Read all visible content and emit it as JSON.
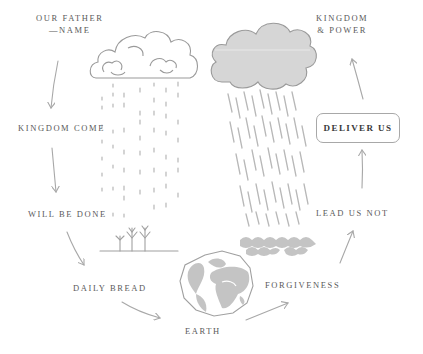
{
  "diagram": {
    "type": "cycle",
    "colors": {
      "text": "#5a5a5a",
      "stroke": "#a8a8a8",
      "fill": "#c4c4c4",
      "highlight_text": "#3a3a3a"
    },
    "nodes": [
      {
        "id": "our-father",
        "lines": [
          "OUR FATHER",
          "—NAME"
        ]
      },
      {
        "id": "kingdom-come",
        "lines": [
          "KINGDOM COME"
        ]
      },
      {
        "id": "will-be-done",
        "lines": [
          "WILL BE DONE"
        ]
      },
      {
        "id": "daily-bread",
        "lines": [
          "DAILY BREAD"
        ]
      },
      {
        "id": "earth",
        "lines": [
          "EARTH"
        ]
      },
      {
        "id": "forgiveness",
        "lines": [
          "FORGIVENESS"
        ]
      },
      {
        "id": "lead-us-not",
        "lines": [
          "LEAD US NOT"
        ]
      },
      {
        "id": "deliver-us",
        "lines": [
          "DELIVER US"
        ],
        "highlighted": true
      },
      {
        "id": "kingdom-power",
        "lines": [
          "KINGDOM",
          "& POWER"
        ]
      }
    ],
    "illustrations": [
      "outline-cloud-icon",
      "light-rain-icon",
      "filled-cloud-icon",
      "heavy-rain-icon",
      "seedlings-icon",
      "globe-icon",
      "waves-icon"
    ]
  }
}
